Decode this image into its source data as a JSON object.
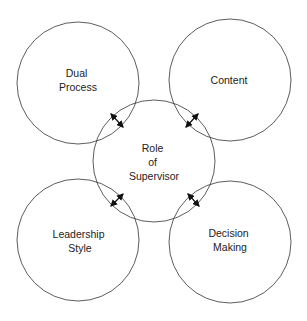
{
  "diagram": {
    "center": {
      "lines": [
        "Role",
        "of",
        "Supervisor"
      ]
    },
    "nodes": [
      {
        "id": "top-left",
        "lines": [
          "Dual",
          "Process"
        ]
      },
      {
        "id": "top-right",
        "lines": [
          "Content"
        ]
      },
      {
        "id": "bottom-left",
        "lines": [
          "Leadership",
          "Style"
        ]
      },
      {
        "id": "bottom-right",
        "lines": [
          "Decision",
          "Making"
        ]
      }
    ],
    "connectors": "bidirectional arrows between center and each outer circle",
    "colors": {
      "stroke": "#333333",
      "text": "#222222",
      "background": "#ffffff"
    }
  }
}
